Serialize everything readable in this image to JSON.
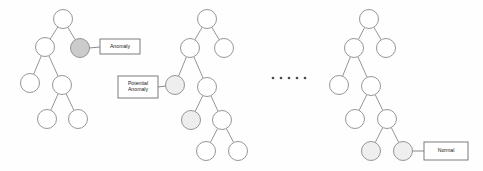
{
  "figure": {
    "background_color": "#fefefe",
    "width": 483,
    "height": 171
  },
  "style": {
    "node_fill_normal": "#ffffff",
    "node_fill_anomaly": "#cbcbcb",
    "node_fill_potential": "#eeeeee",
    "node_fill_normal_shaded": "#efefef",
    "node_stroke": "#8a8a8a",
    "edge_color": "#8a8a8a",
    "label_text_color": "#1a1a1a",
    "label_border_color": "#6e6e6e",
    "ellipsis_color": "#4a4a4a",
    "node_radius": 9.5
  },
  "labels": {
    "anomaly": "Anomaly",
    "potential_anomaly_line1": "Potential",
    "potential_anomaly_line2": "Anomaly",
    "normal": "Normal"
  },
  "ellipsis": {
    "dot_count": 5,
    "glyph": "·"
  },
  "trees": [
    {
      "id": "tree-1",
      "name": "left-tree",
      "nodes": [
        {
          "id": "t1-n0",
          "name": "root-node",
          "cx": 63,
          "cy": 19,
          "state": "normal"
        },
        {
          "id": "t1-n1",
          "name": "internal-node",
          "cx": 45,
          "cy": 47,
          "state": "normal"
        },
        {
          "id": "t1-n2",
          "name": "anomaly-node",
          "cx": 80,
          "cy": 48,
          "state": "anomaly"
        },
        {
          "id": "t1-n3",
          "name": "leaf-node",
          "cx": 30,
          "cy": 83,
          "state": "normal"
        },
        {
          "id": "t1-n4",
          "name": "internal-node",
          "cx": 62,
          "cy": 85,
          "state": "normal"
        },
        {
          "id": "t1-n5",
          "name": "leaf-node",
          "cx": 47,
          "cy": 119,
          "state": "normal"
        },
        {
          "id": "t1-n6",
          "name": "leaf-node",
          "cx": 78,
          "cy": 119,
          "state": "normal"
        }
      ],
      "edges": [
        [
          "t1-n0",
          "t1-n1"
        ],
        [
          "t1-n0",
          "t1-n2"
        ],
        [
          "t1-n1",
          "t1-n3"
        ],
        [
          "t1-n1",
          "t1-n4"
        ],
        [
          "t1-n4",
          "t1-n5"
        ],
        [
          "t1-n4",
          "t1-n6"
        ]
      ]
    },
    {
      "id": "tree-2",
      "name": "middle-tree",
      "nodes": [
        {
          "id": "t2-n0",
          "name": "root-node",
          "cx": 207,
          "cy": 19,
          "state": "normal"
        },
        {
          "id": "t2-n1",
          "name": "internal-node",
          "cx": 190,
          "cy": 48,
          "state": "normal"
        },
        {
          "id": "t2-n2",
          "name": "leaf-node",
          "cx": 224,
          "cy": 48,
          "state": "normal"
        },
        {
          "id": "t2-n3",
          "name": "potential-anomaly-node",
          "cx": 175,
          "cy": 85,
          "state": "potential"
        },
        {
          "id": "t2-n4",
          "name": "internal-node",
          "cx": 207,
          "cy": 87,
          "state": "normal"
        },
        {
          "id": "t2-n5",
          "name": "potential-anomaly-node",
          "cx": 191,
          "cy": 120,
          "state": "potential"
        },
        {
          "id": "t2-n6",
          "name": "internal-node",
          "cx": 222,
          "cy": 120,
          "state": "normal"
        },
        {
          "id": "t2-n7",
          "name": "leaf-node",
          "cx": 206,
          "cy": 151,
          "state": "normal"
        },
        {
          "id": "t2-n8",
          "name": "leaf-node",
          "cx": 238,
          "cy": 151,
          "state": "normal"
        }
      ],
      "edges": [
        [
          "t2-n0",
          "t2-n1"
        ],
        [
          "t2-n0",
          "t2-n2"
        ],
        [
          "t2-n1",
          "t2-n3"
        ],
        [
          "t2-n1",
          "t2-n4"
        ],
        [
          "t2-n4",
          "t2-n5"
        ],
        [
          "t2-n4",
          "t2-n6"
        ],
        [
          "t2-n6",
          "t2-n7"
        ],
        [
          "t2-n6",
          "t2-n8"
        ]
      ]
    },
    {
      "id": "tree-3",
      "name": "right-tree",
      "nodes": [
        {
          "id": "t3-n0",
          "name": "root-node",
          "cx": 369,
          "cy": 19,
          "state": "normal"
        },
        {
          "id": "t3-n1",
          "name": "internal-node",
          "cx": 354,
          "cy": 48,
          "state": "normal"
        },
        {
          "id": "t3-n2",
          "name": "leaf-node",
          "cx": 386,
          "cy": 48,
          "state": "normal"
        },
        {
          "id": "t3-n3",
          "name": "leaf-node",
          "cx": 339,
          "cy": 85,
          "state": "normal"
        },
        {
          "id": "t3-n4",
          "name": "internal-node",
          "cx": 371,
          "cy": 86,
          "state": "normal"
        },
        {
          "id": "t3-n5",
          "name": "leaf-node",
          "cx": 355,
          "cy": 119,
          "state": "normal"
        },
        {
          "id": "t3-n6",
          "name": "internal-node",
          "cx": 387,
          "cy": 119,
          "state": "normal"
        },
        {
          "id": "t3-n7",
          "name": "normal-shaded-node",
          "cx": 371,
          "cy": 151,
          "state": "normal-shaded"
        },
        {
          "id": "t3-n8",
          "name": "normal-shaded-node",
          "cx": 403,
          "cy": 151,
          "state": "normal-shaded"
        }
      ],
      "edges": [
        [
          "t3-n0",
          "t3-n1"
        ],
        [
          "t3-n0",
          "t3-n2"
        ],
        [
          "t3-n1",
          "t3-n3"
        ],
        [
          "t3-n1",
          "t3-n4"
        ],
        [
          "t3-n4",
          "t3-n5"
        ],
        [
          "t3-n4",
          "t3-n6"
        ],
        [
          "t3-n6",
          "t3-n7"
        ],
        [
          "t3-n6",
          "t3-n8"
        ]
      ]
    }
  ],
  "callouts": [
    {
      "id": "callout-anomaly",
      "name": "anomaly-callout",
      "label_key": "anomaly",
      "lines": [
        "Anomaly"
      ],
      "box": {
        "x": 100,
        "y": 39,
        "w": 40,
        "h": 15
      },
      "connector": {
        "x1": 89,
        "y1": 48,
        "x2": 100,
        "y2": 47
      },
      "target_node": "t1-n2"
    },
    {
      "id": "callout-potential-anomaly",
      "name": "potential-anomaly-callout",
      "label_key": "potential_anomaly",
      "lines": [
        "Potential",
        "Anomaly"
      ],
      "box": {
        "x": 118,
        "y": 76,
        "w": 40,
        "h": 22
      },
      "connector": {
        "x1": 158,
        "y1": 87,
        "x2": 166,
        "y2": 86
      },
      "target_node": "t2-n3"
    },
    {
      "id": "callout-normal",
      "name": "normal-callout",
      "label_key": "normal",
      "lines": [
        "Normal"
      ],
      "box": {
        "x": 424,
        "y": 142,
        "w": 44,
        "h": 18
      },
      "connector": {
        "x1": 412,
        "y1": 151,
        "x2": 424,
        "y2": 151
      },
      "target_node": "t3-n8"
    }
  ],
  "ellipsis_dots": {
    "name": "series-ellipsis",
    "cy": 78,
    "xs": [
      273,
      281,
      289,
      297,
      305
    ],
    "r": 1.3
  }
}
